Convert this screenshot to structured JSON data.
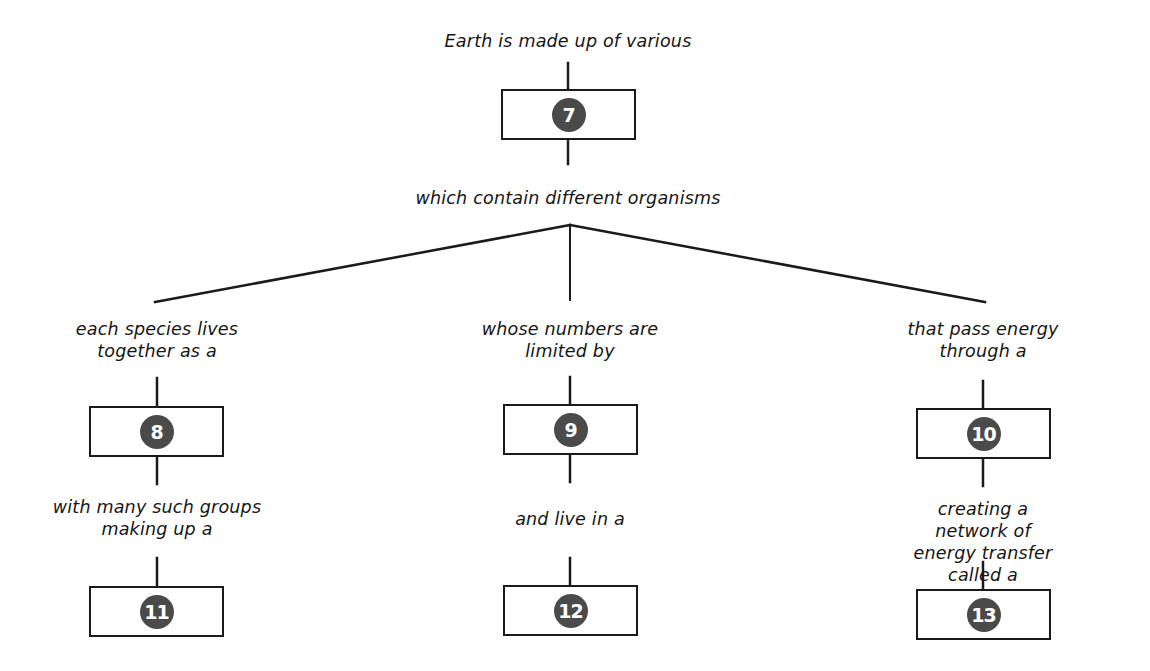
{
  "diagram": {
    "type": "concept-map",
    "colors": {
      "line": "#1a1a1a",
      "badge_fill": "#4a4a4a",
      "badge_text": "#ffffff",
      "background": "#ffffff"
    },
    "root": {
      "label_above": "Earth is made up of various",
      "box_number": "7",
      "label_below": "which contain different organisms"
    },
    "branches": [
      {
        "label_top": "each species lives\ntogether as a",
        "box_number": "8",
        "label_middle": "with many such groups\nmaking up a",
        "bottom_box_number": "11"
      },
      {
        "label_top": "whose numbers are\nlimited by",
        "box_number": "9",
        "label_middle": "and live in a",
        "bottom_box_number": "12"
      },
      {
        "label_top": "that pass energy\nthrough a",
        "box_number": "10",
        "label_middle": "creating a network of\nenergy transfer called a",
        "bottom_box_number": "13"
      }
    ]
  }
}
